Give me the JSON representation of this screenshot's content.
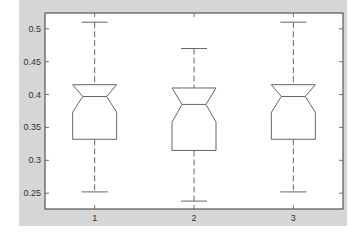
{
  "colors": {
    "figure_bg": "#d6d6d6",
    "axes_bg": "#ffffff",
    "axes_edge": "#555555",
    "box_line": "#666666",
    "tick_text": "#333333"
  },
  "chart_data": {
    "type": "boxplot",
    "title": "",
    "xlabel": "",
    "ylabel": "",
    "notched": true,
    "grid": false,
    "legend": null,
    "categories": [
      "1",
      "2",
      "3"
    ],
    "ylim": [
      0.226,
      0.524
    ],
    "yticks": [
      0.25,
      0.3,
      0.35,
      0.4,
      0.45,
      0.5
    ],
    "ytick_labels": [
      "0.25",
      "0.3",
      "0.35",
      "0.4",
      "0.45",
      "0.5"
    ],
    "xtick_labels": [
      "1",
      "2",
      "3"
    ],
    "boxes": [
      {
        "label": "1",
        "whisker_high": 0.51,
        "q3": 0.415,
        "median": 0.397,
        "notch_low": 0.373,
        "q1": 0.332,
        "whisker_low": 0.252
      },
      {
        "label": "2",
        "whisker_high": 0.47,
        "q3": 0.41,
        "median": 0.385,
        "notch_low": 0.358,
        "q1": 0.315,
        "whisker_low": 0.238
      },
      {
        "label": "3",
        "whisker_high": 0.51,
        "q3": 0.415,
        "median": 0.397,
        "notch_low": 0.373,
        "q1": 0.332,
        "whisker_low": 0.252
      }
    ]
  }
}
